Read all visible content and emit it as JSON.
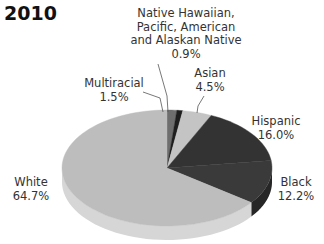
{
  "chart_data": {
    "type": "pie",
    "title": "2010",
    "style": "3d",
    "slices": [
      {
        "label": "Multiracial",
        "value": 1.5,
        "value_label": "1.5%",
        "color": "#6e6e6e",
        "side": "#555555"
      },
      {
        "label": "Native Hawaiian, Pacific, American and Alaskan Native",
        "value": 0.9,
        "value_label": "0.9%",
        "color": "#1e1e1e",
        "side": "#111111"
      },
      {
        "label": "Asian",
        "value": 4.5,
        "value_label": "4.5%",
        "color": "#c4c4c4",
        "side": "#a8a8a8"
      },
      {
        "label": "Hispanic",
        "value": 16.0,
        "value_label": "16.0%",
        "color": "#333333",
        "side": "#222222"
      },
      {
        "label": "Black",
        "value": 12.2,
        "value_label": "12.2%",
        "color": "#3a3a3a",
        "side": "#262626"
      },
      {
        "label": "White",
        "value": 64.7,
        "value_label": "64.7%",
        "color": "#bdbdbd",
        "side": "#d6d6d6"
      }
    ]
  },
  "labels": {
    "title": "2010",
    "native_line1": "Native Hawaiian,",
    "native_line2": "Pacific, American",
    "native_line3": "and Alaskan Native",
    "native_value": "0.9%",
    "multiracial": "Multiracial",
    "multiracial_value": "1.5%",
    "asian": "Asian",
    "asian_value": "4.5%",
    "hispanic": "Hispanic",
    "hispanic_value": "16.0%",
    "black": "Black",
    "black_value": "12.2%",
    "white": "White",
    "white_value": "64.7%"
  }
}
